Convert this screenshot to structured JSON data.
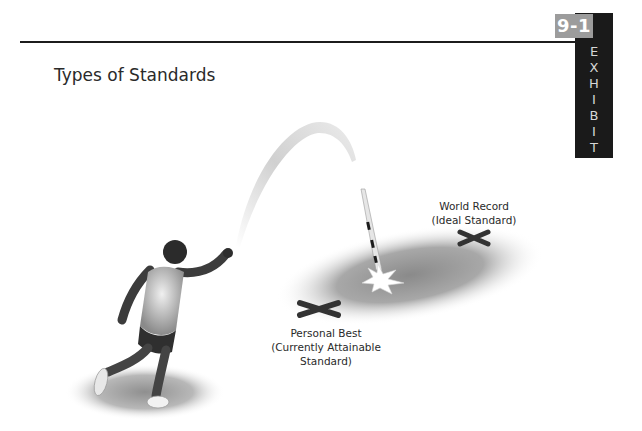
{
  "exhibit": {
    "number": "9-1",
    "word": "EXHIBIT",
    "letters": [
      "E",
      "X",
      "H",
      "I",
      "B",
      "I",
      "T"
    ],
    "colors": {
      "number_bg": "#9c9c9c",
      "block_bg": "#1a1a1a",
      "text": "#d6d6d6"
    }
  },
  "figure": {
    "title": "Types of Standards",
    "icons": [
      "athlete-figure-icon",
      "javelin-arc-icon",
      "javelin-icon",
      "impact-star-icon",
      "x-marker-icon"
    ],
    "labels": {
      "world_record": {
        "line1": "World Record",
        "line2": "(Ideal Standard)"
      },
      "personal_best": {
        "line1": "Personal Best",
        "line2": "(Currently Attainable",
        "line3": "Standard)"
      }
    }
  }
}
